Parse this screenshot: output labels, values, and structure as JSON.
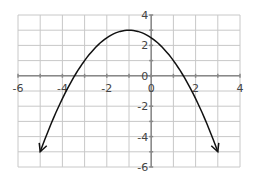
{
  "chart_data": {
    "type": "line",
    "title": "",
    "xlabel": "",
    "ylabel": "",
    "xlim": [
      -6,
      4
    ],
    "ylim": [
      -6,
      4
    ],
    "grid": true,
    "x_ticks": [
      "-6",
      "-4",
      "-2",
      "0",
      "2",
      "4"
    ],
    "y_ticks": [
      "4",
      "2",
      "0",
      "-2",
      "-4",
      "-6"
    ],
    "series": [
      {
        "name": "parabola",
        "equation": "y = 3 - 0.5(x+1)^2",
        "vertex": [
          -1,
          3
        ],
        "x": [
          -5,
          -4,
          -3,
          -2,
          -1,
          0,
          1,
          2,
          3
        ],
        "y": [
          -5,
          -1.5,
          1,
          2.5,
          3,
          2.5,
          1,
          -1.5,
          -5
        ],
        "arrows": "both ends"
      }
    ]
  }
}
